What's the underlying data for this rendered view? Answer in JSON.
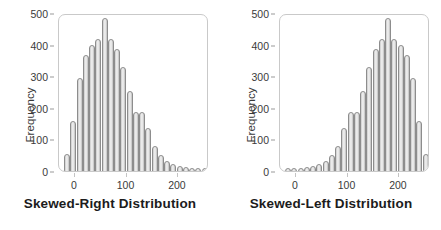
{
  "figure": {
    "background_color": "#ffffff",
    "bar_fill_color": "#e3e3e3",
    "bar_edge_color": "#8d8d8d",
    "frame_color": "#c9c9c9",
    "text_color": "#3a3a3a"
  },
  "chart_data": [
    {
      "type": "bar",
      "title": "Skewed-Right Distribution",
      "xlabel": "Skewed-Right Distribution",
      "ylabel": "Frequency",
      "xlim": [
        -8,
        232
      ],
      "ylim": [
        0,
        530
      ],
      "xticks": [
        0,
        100,
        200
      ],
      "yticks": [
        0,
        100,
        200,
        300,
        400,
        500
      ],
      "grid": false,
      "legend": null,
      "bin_width": 10,
      "categories": [
        5,
        15,
        25,
        35,
        45,
        55,
        65,
        75,
        85,
        95,
        105,
        115,
        125,
        135,
        145,
        155,
        165,
        175,
        185,
        195,
        205,
        215,
        225
      ],
      "values": [
        55,
        165,
        310,
        385,
        420,
        440,
        510,
        440,
        405,
        345,
        265,
        195,
        195,
        140,
        80,
        50,
        30,
        20,
        12,
        10,
        8,
        8,
        8
      ]
    },
    {
      "type": "bar",
      "title": "Skewed-Left Distribution",
      "xlabel": "Skewed-Left Distribution",
      "ylabel": "Frequency",
      "xlim": [
        -8,
        232
      ],
      "ylim": [
        0,
        530
      ],
      "xticks": [
        0,
        100,
        200
      ],
      "yticks": [
        0,
        100,
        200,
        300,
        400,
        500
      ],
      "grid": false,
      "legend": null,
      "bin_width": 10,
      "categories": [
        5,
        15,
        25,
        35,
        45,
        55,
        65,
        75,
        85,
        95,
        105,
        115,
        125,
        135,
        145,
        155,
        165,
        175,
        185,
        195,
        205,
        215,
        225
      ],
      "values": [
        8,
        8,
        8,
        10,
        12,
        20,
        30,
        50,
        80,
        140,
        195,
        195,
        265,
        345,
        405,
        440,
        510,
        440,
        420,
        385,
        310,
        165,
        55
      ]
    }
  ],
  "panels": [
    {
      "name": "skewed-right",
      "ylabel": "Frequency",
      "xtitle": "Skewed-Right Distribution",
      "ytick_labels": [
        "500",
        "400",
        "300",
        "200",
        "100",
        "0"
      ],
      "xtick_labels": [
        "0",
        "100",
        "200"
      ]
    },
    {
      "name": "skewed-left",
      "ylabel": "Frequency",
      "xtitle": "Skewed-Left Distribution",
      "ytick_labels": [
        "500",
        "400",
        "300",
        "200",
        "100",
        "0"
      ],
      "xtick_labels": [
        "0",
        "100",
        "200"
      ]
    }
  ]
}
